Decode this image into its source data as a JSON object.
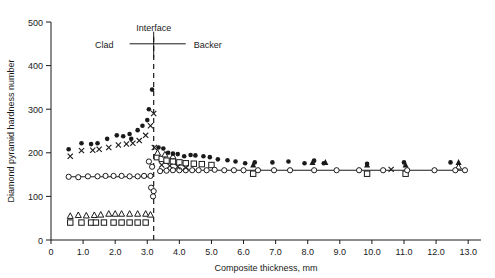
{
  "chart_data": {
    "type": "scatter",
    "title": "",
    "xlabel": "Composite thickness, mm",
    "ylabel": "Diamond pyramid hardness number",
    "xlim": [
      0,
      13.4
    ],
    "ylim": [
      0,
      500
    ],
    "xticks": [
      0,
      1.0,
      2.0,
      3.0,
      4.0,
      5.0,
      6.0,
      7.0,
      8.0,
      9.0,
      10.0,
      11.0,
      12.0,
      13.0
    ],
    "xticklabels": [
      "0",
      "1.0",
      "2.0",
      "3.0",
      "4.0",
      "5.0",
      "6.0",
      "7.0",
      "8.0",
      "9.0",
      "10.0",
      "11.0",
      "12.0",
      "13.0"
    ],
    "yticks": [
      0,
      100,
      200,
      300,
      400,
      500
    ],
    "yticklabels": [
      "0",
      "100",
      "200",
      "300",
      "400",
      "500"
    ],
    "grid": false,
    "legend": "none",
    "annotations": [
      {
        "name": "interface-label",
        "text": "Interface",
        "x": 3.2,
        "y": 487
      },
      {
        "name": "clad-label",
        "text": "Clad",
        "x": 1.95,
        "y": 447
      },
      {
        "name": "backer-label",
        "text": "Backer",
        "x": 4.45,
        "y": 447
      }
    ],
    "interface_x": 3.2,
    "reference_line_y": 160,
    "clad_reference_line_y": 145,
    "series": [
      {
        "name": "filled-circle",
        "marker": "filled-circle",
        "points": [
          [
            0.55,
            208
          ],
          [
            0.95,
            222
          ],
          [
            1.25,
            220
          ],
          [
            1.45,
            222
          ],
          [
            1.75,
            232
          ],
          [
            2.05,
            240
          ],
          [
            2.25,
            238
          ],
          [
            2.45,
            243
          ],
          [
            2.5,
            232
          ],
          [
            2.7,
            252
          ],
          [
            2.85,
            262
          ],
          [
            3.0,
            275
          ],
          [
            3.05,
            300
          ],
          [
            3.15,
            345
          ],
          [
            3.35,
            212
          ],
          [
            3.5,
            210
          ],
          [
            3.65,
            200
          ],
          [
            3.8,
            198
          ],
          [
            3.95,
            197
          ],
          [
            4.15,
            192
          ],
          [
            4.35,
            195
          ],
          [
            4.5,
            194
          ],
          [
            4.75,
            192
          ],
          [
            4.95,
            190
          ],
          [
            5.2,
            185
          ],
          [
            5.5,
            183
          ],
          [
            5.75,
            180
          ],
          [
            6.05,
            176
          ],
          [
            6.35,
            178
          ],
          [
            6.9,
            178
          ],
          [
            7.4,
            180
          ],
          [
            7.9,
            176
          ],
          [
            8.2,
            182
          ],
          [
            8.5,
            176
          ],
          [
            9.85,
            175
          ],
          [
            11.0,
            178
          ],
          [
            12.45,
            178
          ]
        ]
      },
      {
        "name": "cross-mark",
        "marker": "x",
        "points": [
          [
            0.6,
            192
          ],
          [
            0.95,
            205
          ],
          [
            1.3,
            206
          ],
          [
            1.5,
            208
          ],
          [
            1.8,
            212
          ],
          [
            2.1,
            218
          ],
          [
            2.35,
            220
          ],
          [
            2.55,
            222
          ],
          [
            2.75,
            228
          ],
          [
            2.95,
            240
          ],
          [
            3.1,
            262
          ],
          [
            3.2,
            290
          ],
          [
            3.22,
            212
          ],
          [
            3.45,
            172
          ],
          [
            3.7,
            170
          ],
          [
            3.95,
            168
          ],
          [
            4.2,
            166
          ],
          [
            10.6,
            162
          ]
        ]
      },
      {
        "name": "open-circle",
        "marker": "open-circle",
        "points": [
          [
            0.55,
            145
          ],
          [
            0.85,
            144
          ],
          [
            1.15,
            146
          ],
          [
            1.45,
            146
          ],
          [
            1.7,
            147
          ],
          [
            1.95,
            147
          ],
          [
            2.2,
            147
          ],
          [
            2.45,
            146
          ],
          [
            2.7,
            146
          ],
          [
            2.9,
            147
          ],
          [
            3.1,
            147
          ],
          [
            3.05,
            180
          ],
          [
            3.15,
            168
          ],
          [
            3.12,
            120
          ],
          [
            3.2,
            112
          ],
          [
            3.18,
            100
          ],
          [
            3.4,
            158
          ],
          [
            3.6,
            159
          ],
          [
            3.8,
            160
          ],
          [
            4.0,
            160
          ],
          [
            4.2,
            160
          ],
          [
            4.4,
            160
          ],
          [
            4.6,
            160
          ],
          [
            4.85,
            160
          ],
          [
            5.1,
            161
          ],
          [
            5.4,
            160
          ],
          [
            5.7,
            160
          ],
          [
            6.0,
            160
          ],
          [
            6.45,
            160
          ],
          [
            6.95,
            160
          ],
          [
            7.45,
            160
          ],
          [
            8.2,
            160
          ],
          [
            8.9,
            160
          ],
          [
            9.6,
            160
          ],
          [
            10.35,
            160
          ],
          [
            11.1,
            160
          ],
          [
            11.95,
            160
          ],
          [
            12.6,
            160
          ],
          [
            12.9,
            160
          ]
        ]
      },
      {
        "name": "open-square",
        "marker": "open-square",
        "points": [
          [
            0.6,
            40
          ],
          [
            0.95,
            40
          ],
          [
            1.25,
            40
          ],
          [
            1.4,
            40
          ],
          [
            1.65,
            40
          ],
          [
            1.95,
            40
          ],
          [
            2.2,
            40
          ],
          [
            2.45,
            40
          ],
          [
            2.7,
            40
          ],
          [
            2.95,
            40
          ],
          [
            3.3,
            190
          ],
          [
            3.45,
            186
          ],
          [
            3.6,
            182
          ],
          [
            3.8,
            180
          ],
          [
            4.0,
            178
          ],
          [
            4.2,
            176
          ],
          [
            4.45,
            175
          ],
          [
            4.7,
            174
          ],
          [
            5.0,
            172
          ],
          [
            6.3,
            152
          ],
          [
            9.85,
            152
          ],
          [
            11.05,
            152
          ]
        ]
      },
      {
        "name": "open-triangle",
        "marker": "open-triangle",
        "points": [
          [
            0.6,
            55
          ],
          [
            0.85,
            57
          ],
          [
            1.1,
            56
          ],
          [
            1.35,
            57
          ],
          [
            1.55,
            58
          ],
          [
            1.8,
            60
          ],
          [
            2.0,
            60
          ],
          [
            2.2,
            60
          ],
          [
            2.45,
            60
          ],
          [
            2.7,
            60
          ],
          [
            2.95,
            60
          ],
          [
            3.1,
            58
          ],
          [
            3.32,
            200
          ],
          [
            3.55,
            196
          ],
          [
            3.8,
            192
          ],
          [
            12.7,
            168
          ]
        ]
      },
      {
        "name": "filled-triangle",
        "marker": "filled-triangle",
        "points": [
          [
            6.3,
            172
          ],
          [
            8.15,
            178
          ],
          [
            8.55,
            178
          ],
          [
            9.85,
            172
          ],
          [
            11.05,
            172
          ],
          [
            12.7,
            178
          ]
        ]
      }
    ]
  }
}
